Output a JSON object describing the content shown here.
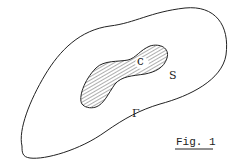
{
  "figure": {
    "caption": "Fig. 1",
    "labels": {
      "outer_curve": "Γ",
      "inner_region": "S",
      "point": "c"
    },
    "colors": {
      "stroke": "#222222",
      "background": "#ffffff"
    }
  }
}
